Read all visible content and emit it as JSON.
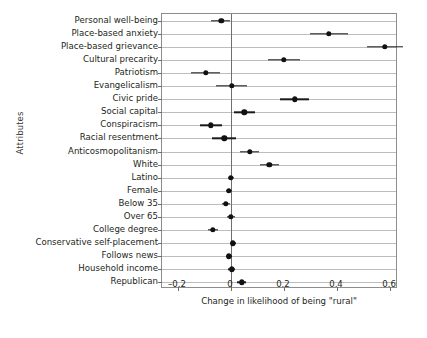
{
  "chart_data": {
    "type": "scatter",
    "title": "",
    "xlabel": "Change in likelihood of being \"rural\"",
    "ylabel": "Attributes",
    "xlim": [
      -0.26,
      0.63
    ],
    "xticks": [
      -0.2,
      0,
      0.2,
      0.4,
      0.6
    ],
    "xticklabels": [
      "–0.2",
      "0",
      "0.2",
      "0.4",
      "0.6"
    ],
    "grid": "horizontal",
    "legend": "none",
    "zero_reference_line": 0,
    "categories": [
      "Personal well-being",
      "Place-based anxiety",
      "Place-based grievance",
      "Cultural precarity",
      "Patriotism",
      "Evangelicalism",
      "Civic pride",
      "Social capital",
      "Conspiracism",
      "Racial resentment",
      "Anticosmopolitanism",
      "White",
      "Latino",
      "Female",
      "Below 35",
      "Over 65",
      "College degree",
      "Conservative self-placement",
      "Follows news",
      "Household income",
      "Republican"
    ],
    "values": [
      -0.037,
      0.37,
      0.58,
      0.2,
      -0.095,
      0.003,
      0.24,
      0.05,
      -0.075,
      -0.025,
      0.07,
      0.145,
      0.0,
      -0.008,
      -0.02,
      0.0,
      -0.068,
      0.008,
      -0.008,
      0.003,
      0.04
    ],
    "ci_low": [
      -0.075,
      0.3,
      0.512,
      0.14,
      -0.15,
      -0.055,
      0.185,
      0.01,
      -0.115,
      -0.07,
      0.035,
      0.11,
      -0.012,
      -0.02,
      -0.035,
      -0.014,
      -0.085,
      -0.002,
      -0.02,
      -0.01,
      0.022
    ],
    "ci_high": [
      -0.003,
      0.44,
      0.648,
      0.262,
      -0.04,
      0.062,
      0.296,
      0.092,
      -0.035,
      0.02,
      0.105,
      0.182,
      0.012,
      0.004,
      -0.005,
      0.014,
      -0.05,
      0.018,
      0.004,
      0.016,
      0.058
    ],
    "series_name": "Change in likelihood of being rural",
    "point_color": "#111111",
    "ci_color": "#1a1a1a",
    "grid_color": "#bdbdbd",
    "axis_color": "#8d8d8d"
  }
}
